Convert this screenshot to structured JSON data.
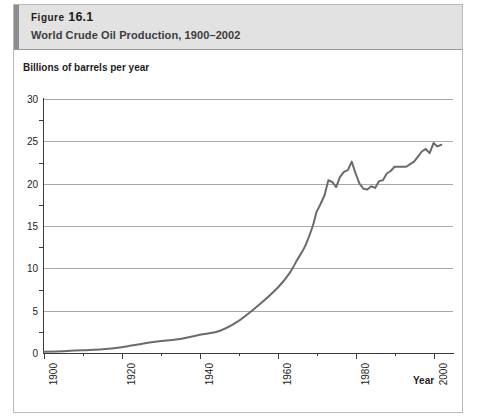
{
  "figure": {
    "label_prefix": "Figure",
    "label_number": "16.1",
    "subtitle": "World Crude Oil Production, 1900–2002"
  },
  "colors": {
    "header_band": "#e2e2e2",
    "header_accent": "#8c8c8c",
    "line": "#6b6b6b",
    "gridline": "#a8a8a8",
    "axis": "#3a3a3a",
    "text": "#1d1d1d"
  },
  "chart_data": {
    "type": "line",
    "title": "World Crude Oil Production, 1900–2002",
    "subtitle": "",
    "xlabel": "Year",
    "ylabel": "Billions of barrels per year",
    "xlim": [
      1900,
      2005
    ],
    "ylim": [
      0,
      30
    ],
    "grid": true,
    "legend": false,
    "x_ticks": [
      1900,
      1920,
      1940,
      1960,
      1980,
      2000
    ],
    "x_tick_labels": [
      "1900",
      "1920",
      "1940",
      "1960",
      "1980",
      "2000"
    ],
    "x_minor_ticks": [
      1910,
      1930,
      1950,
      1970,
      1990
    ],
    "y_ticks": [
      0,
      5,
      10,
      15,
      20,
      25,
      30
    ],
    "y_tick_labels": [
      "0",
      "5",
      "10",
      "15",
      "20",
      "25",
      "30"
    ],
    "y_minor_ticks": [
      2.5,
      7.5,
      12.5,
      17.5,
      22.5,
      27.5
    ],
    "series": [
      {
        "name": "World crude oil production",
        "color": "#6b6b6b",
        "x": [
          1900,
          1905,
          1910,
          1915,
          1920,
          1925,
          1930,
          1935,
          1940,
          1945,
          1950,
          1955,
          1960,
          1963,
          1965,
          1967,
          1969,
          1970,
          1971,
          1972,
          1973,
          1974,
          1975,
          1976,
          1977,
          1978,
          1979,
          1980,
          1981,
          1982,
          1983,
          1984,
          1985,
          1986,
          1987,
          1988,
          1989,
          1990,
          1991,
          1992,
          1993,
          1994,
          1995,
          1996,
          1997,
          1998,
          1999,
          2000,
          2001,
          2002
        ],
        "y": [
          0.15,
          0.22,
          0.33,
          0.43,
          0.69,
          1.07,
          1.41,
          1.66,
          2.15,
          2.6,
          3.8,
          5.6,
          7.7,
          9.4,
          11.0,
          12.6,
          15.0,
          16.7,
          17.6,
          18.6,
          20.4,
          20.2,
          19.6,
          20.8,
          21.4,
          21.6,
          22.6,
          21.2,
          20.0,
          19.4,
          19.3,
          19.7,
          19.5,
          20.3,
          20.4,
          21.2,
          21.5,
          22.0,
          22.0,
          22.0,
          22.0,
          22.3,
          22.6,
          23.2,
          23.8,
          24.1,
          23.6,
          24.8,
          24.4,
          24.6
        ]
      }
    ]
  }
}
